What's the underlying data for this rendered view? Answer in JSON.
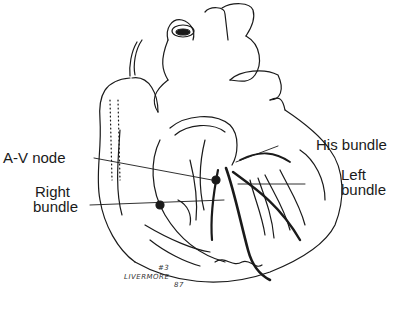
{
  "diagram": {
    "labels": {
      "av_node": "A-V node",
      "right_bundle_1": "Right",
      "right_bundle_2": "bundle",
      "his_bundle": "His bundle",
      "left_bundle_1": "Left",
      "left_bundle_2": "bundle"
    },
    "signature": {
      "name": "LIVERMORE",
      "mark": "#3",
      "year": "87"
    },
    "colors": {
      "ink": "#1a1a1a",
      "background": "#ffffff"
    }
  }
}
